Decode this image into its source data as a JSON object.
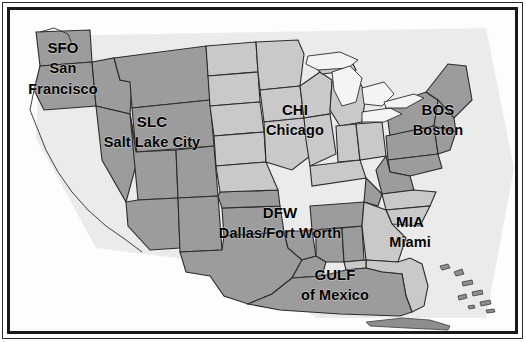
{
  "map": {
    "title": "United States airline hub regions map",
    "frame": {
      "outer_line_color": "#2a2a2a",
      "inner_line_color": "#1a1a1a"
    },
    "colors": {
      "background": "#fdfdfd",
      "region_highlighted": "#9c9c9c",
      "region_plain": "#c9c9c9",
      "border_line": "#2b2b2b",
      "label_text": "#000000",
      "shadow": "#d8d8d8"
    },
    "labels": [
      {
        "id": "sfo",
        "code": "SFO",
        "name_line1": "San",
        "name_line2": "Francisco",
        "x": 63,
        "y": 40
      },
      {
        "id": "slc",
        "code": "SLC",
        "name": "Salt Lake City",
        "x": 152,
        "y": 114
      },
      {
        "id": "chi",
        "code": "CHI",
        "name": "Chicago",
        "x": 295,
        "y": 102
      },
      {
        "id": "bos",
        "code": "BOS",
        "name": "Boston",
        "x": 438,
        "y": 102
      },
      {
        "id": "dfw",
        "code": "DFW",
        "name": "Dallas/Fort Worth",
        "x": 280,
        "y": 205
      },
      {
        "id": "mia",
        "code": "MIA",
        "name": "Miami",
        "x": 410,
        "y": 214
      },
      {
        "id": "gulf",
        "code": "GULF",
        "name": "of Mexico",
        "x": 335,
        "y": 267
      }
    ]
  }
}
